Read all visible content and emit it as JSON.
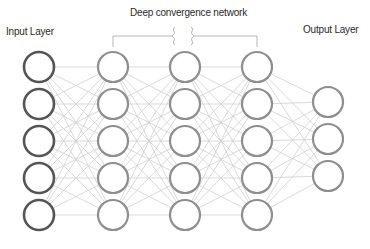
{
  "labels": {
    "input_layer": "Input Layer",
    "deep_network": "Deep convergence network",
    "output_layer": "Output Layer"
  },
  "layers": [
    {
      "name": "input",
      "x": 39,
      "nodes": [
        67,
        104,
        141,
        178,
        215
      ],
      "stroke": "#555555",
      "stroke_width": 2.6
    },
    {
      "name": "hidden-1",
      "x": 113,
      "nodes": [
        67,
        104,
        141,
        178,
        215
      ],
      "stroke": "#8e8e8e",
      "stroke_width": 2.2
    },
    {
      "name": "hidden-2",
      "x": 185,
      "nodes": [
        67,
        104,
        141,
        178,
        215
      ],
      "stroke": "#8e8e8e",
      "stroke_width": 2.2
    },
    {
      "name": "hidden-3",
      "x": 257,
      "nodes": [
        67,
        104,
        141,
        178,
        215
      ],
      "stroke": "#8e8e8e",
      "stroke_width": 2.2
    },
    {
      "name": "output",
      "x": 328,
      "nodes": [
        102,
        139,
        176
      ],
      "stroke": "#8e8e8e",
      "stroke_width": 2.2
    }
  ],
  "node_radius": 15,
  "edge_color": "#cfcfcf",
  "bracket": {
    "x1": 113,
    "x2": 257,
    "y": 36,
    "break_left": 176,
    "break_right": 194,
    "color": "#b5b5b5"
  }
}
